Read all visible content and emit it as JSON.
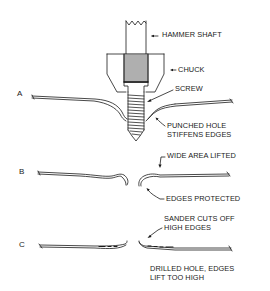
{
  "diagram": {
    "panels": [
      {
        "id": "A",
        "letter": "A",
        "labels": {
          "hammer_shaft": "HAMMER SHAFT",
          "chuck": "CHUCK",
          "screw": "SCREW",
          "note_line1": "PUNCHED HOLE",
          "note_line2": "STIFFENS EDGES"
        }
      },
      {
        "id": "B",
        "letter": "B",
        "labels": {
          "top": "WIDE AREA LIFTED",
          "bottom": "EDGES PROTECTED"
        }
      },
      {
        "id": "C",
        "letter": "C",
        "labels": {
          "top_line1": "SANDER CUTS OFF",
          "top_line2": "HIGH EDGES",
          "bottom_line1": "DRILLED HOLE, EDGES",
          "bottom_line2": "LIFT TOO HIGH"
        }
      }
    ],
    "colors": {
      "ink": "#1a1a1a",
      "background": "#ffffff"
    }
  }
}
